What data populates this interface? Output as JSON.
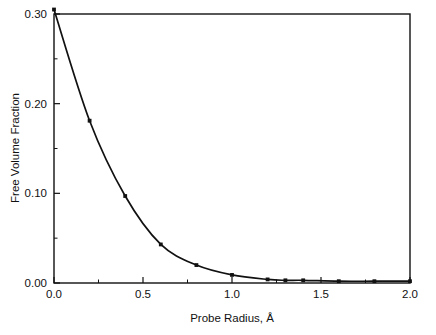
{
  "chart_data": {
    "type": "line",
    "title": "",
    "subtitle": "",
    "xlabel": "Probe Radius, Å",
    "ylabel": "Free Volume Fraction",
    "xlim": [
      0.0,
      2.0
    ],
    "ylim": [
      0.0,
      0.3
    ],
    "grid": false,
    "legend": null,
    "x_ticks": [
      "0.0",
      "0.5",
      "1.0",
      "1.5",
      "2.0"
    ],
    "x_tick_values": [
      0.0,
      0.5,
      1.0,
      1.5,
      2.0
    ],
    "x_minor_tick_values": [
      0.25,
      0.75,
      1.25,
      1.75
    ],
    "y_ticks": [
      "0.00",
      "0.10",
      "0.20",
      "0.30"
    ],
    "y_tick_values": [
      0.0,
      0.1,
      0.2,
      0.3
    ],
    "y_minor_tick_values": [
      0.05,
      0.15,
      0.25
    ],
    "series": [
      {
        "name": "Free volume fraction vs probe radius",
        "marker": "square",
        "x": [
          0.0,
          0.2,
          0.4,
          0.6,
          0.8,
          1.0,
          1.2,
          1.3,
          1.4,
          1.6,
          1.8,
          2.0
        ],
        "values": [
          0.305,
          0.181,
          0.097,
          0.043,
          0.02,
          0.009,
          0.004,
          0.003,
          0.003,
          0.002,
          0.002,
          0.002
        ]
      }
    ]
  },
  "axes": {
    "x_title": "Probe Radius, Å",
    "y_title": "Free Volume Fraction"
  },
  "colors": {
    "background": "#ffffff",
    "ink": "#111111",
    "curve": "#111111"
  }
}
